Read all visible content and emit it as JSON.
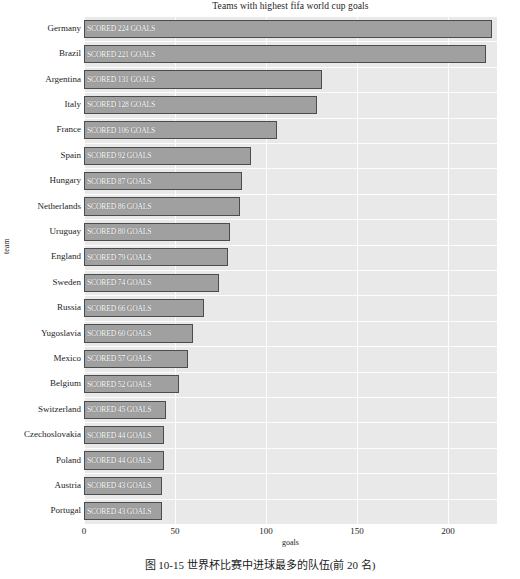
{
  "chart_data": {
    "type": "bar",
    "orientation": "horizontal",
    "title": "Teams with highest fifa world cup goals",
    "xlabel": "goals",
    "ylabel": "team",
    "categories": [
      "Germany",
      "Brazil",
      "Argentina",
      "Italy",
      "France",
      "Spain",
      "Hungary",
      "Netherlands",
      "Uruguay",
      "England",
      "Sweden",
      "Russia",
      "Yugoslavia",
      "Mexico",
      "Belgium",
      "Switzerland",
      "Czechoslovakia",
      "Poland",
      "Austria",
      "Portugal"
    ],
    "values": [
      224,
      221,
      131,
      128,
      106,
      92,
      87,
      86,
      80,
      79,
      74,
      66,
      60,
      57,
      52,
      45,
      44,
      44,
      43,
      43
    ],
    "bar_labels": [
      "SCORED 224 GOALS",
      "SCORED 221 GOALS",
      "SCORED 131 GOALS",
      "SCORED 128 GOALS",
      "SCORED 106 GOALS",
      "SCORED 92 GOALS",
      "SCORED 87 GOALS",
      "SCORED 86 GOALS",
      "SCORED 80 GOALS",
      "SCORED 79 GOALS",
      "SCORED 74 GOALS",
      "SCORED 66 GOALS",
      "SCORED 60 GOALS",
      "SCORED 57 GOALS",
      "SCORED 52 GOALS",
      "SCORED 45 GOALS",
      "SCORED 44 GOALS",
      "SCORED 44 GOALS",
      "SCORED 43 GOALS",
      "SCORED 43 GOALS"
    ],
    "xticks": [
      0,
      50,
      100,
      150,
      200
    ],
    "xtick_labels": [
      "0",
      "50",
      "100",
      "150",
      "200"
    ],
    "xlim": [
      0,
      227
    ],
    "grid": true,
    "legend": null,
    "colors": {
      "bar_fill": "#a0a0a0",
      "bar_edge": "#4c4c4c",
      "plot_background": "#e9e9e9",
      "gridline": "#fdfdfd",
      "bar_label_text": "#ffffff",
      "axis_text": "#1d1d1d"
    }
  },
  "caption": "图 10-15   世界杯比赛中进球最多的队伍(前 20 名)"
}
